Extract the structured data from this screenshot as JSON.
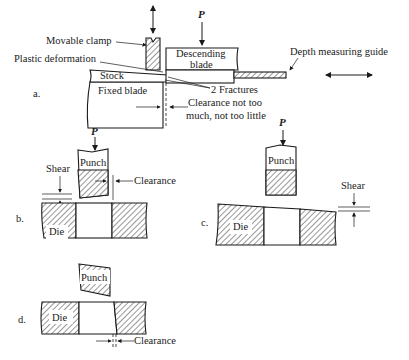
{
  "figure": {
    "panels": [
      {
        "id": "a",
        "label": "a.",
        "force": "P",
        "parts": {
          "movable_clamp": "Movable clamp",
          "descending_blade_l1": "Descending",
          "descending_blade_l2": "blade",
          "plastic_deformation": "Plastic deformation",
          "stock": "Stock",
          "fixed_blade": "Fixed blade",
          "fractures": "2 Fractures",
          "depth_guide": "Depth measuring guide",
          "clearance_l1": "Clearance not too",
          "clearance_l2": "much, not too little"
        }
      },
      {
        "id": "b",
        "label": "b.",
        "force": "P",
        "parts": {
          "punch": "Punch",
          "shear": "Shear",
          "clearance": "Clearance",
          "die": "Die"
        }
      },
      {
        "id": "c",
        "label": "c.",
        "force": "P",
        "parts": {
          "punch": "Punch",
          "shear": "Shear",
          "die": "Die"
        }
      },
      {
        "id": "d",
        "label": "d.",
        "parts": {
          "punch": "Punch",
          "die": "Die",
          "clearance": "Clearance"
        }
      }
    ]
  }
}
